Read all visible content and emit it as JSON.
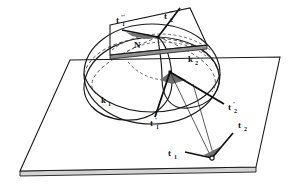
{
  "figure": {
    "background_color": "#ffffff",
    "line_color": "#1a1a1a",
    "dash_color": "#555555",
    "fill_wedge_color": "#6b6b6b",
    "slab_fill_color": "#c8c8c8"
  },
  "labels": {
    "k1": {
      "text": "k",
      "sub": "1"
    },
    "k2": {
      "text": "k",
      "sub": "2"
    },
    "north_pole": {
      "text": "N"
    },
    "t1": {
      "text": "t",
      "sub": "1",
      "prime": ""
    },
    "t2": {
      "text": "t",
      "sub": "2",
      "prime": ""
    },
    "t1_prime": {
      "text": "t",
      "sub": "1",
      "prime": "'"
    },
    "t2_prime": {
      "text": "t",
      "sub": "2",
      "prime": "'"
    },
    "t1_dprime": {
      "text": "t",
      "sub": "1",
      "prime": "''"
    },
    "t2_dprime": {
      "text": "t",
      "sub": "2",
      "prime": "''"
    }
  },
  "geometry": {
    "base_plane": {
      "name": "base-plane",
      "corners": "70,60 280,57 256,167 20,171",
      "thickness_px": 5
    },
    "tangent_plane": {
      "name": "tangent-plane-at-north-pole",
      "corners": "110,25 190,8 207,45 128,62",
      "thickness_px": 4
    },
    "sphere": {
      "name": "sphere",
      "center_x": 152,
      "center_y": 70,
      "radius_x": 70,
      "radius_y": 48
    },
    "circles": [
      {
        "id": "k1",
        "style": "solid-and-dashed"
      },
      {
        "id": "k2",
        "style": "solid-and-dashed"
      }
    ],
    "vertices": [
      {
        "id": "center-point",
        "x": 170,
        "y": 72
      },
      {
        "id": "north-pole-point",
        "x": 158,
        "y": 37
      },
      {
        "id": "ground-point",
        "x": 212,
        "y": 158
      }
    ]
  }
}
